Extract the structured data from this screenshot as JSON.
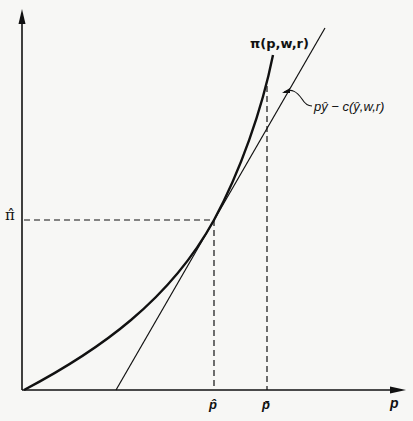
{
  "diagram": {
    "type": "profit function vs. price (convexity of profit function)",
    "colors": {
      "background": "#f7f7f5",
      "ink": "#111111"
    },
    "axes": {
      "x_label": "p",
      "y_label": ""
    },
    "curves": [
      {
        "id": "profit-function",
        "label": "π(p,w,r)",
        "style": "thick convex curve"
      },
      {
        "id": "passive-profit-line",
        "label": "pŷ − c(ŷ,w,r)",
        "style": "thin straight tangent line"
      }
    ],
    "markers": {
      "y_axis_value": "π̂",
      "x_tangent_price": "p̂",
      "x_other_price": "p̄"
    },
    "geometry": {
      "origin": [
        22,
        390
      ],
      "y_axis_top": [
        22,
        10
      ],
      "x_axis_end": [
        405,
        390
      ],
      "tangency_point": [
        214,
        220
      ],
      "tangent_x_intercept": [
        116,
        390
      ],
      "tangent_top": [
        325,
        28
      ],
      "curve_top": [
        273,
        55
      ],
      "pbar_x": 267
    }
  }
}
